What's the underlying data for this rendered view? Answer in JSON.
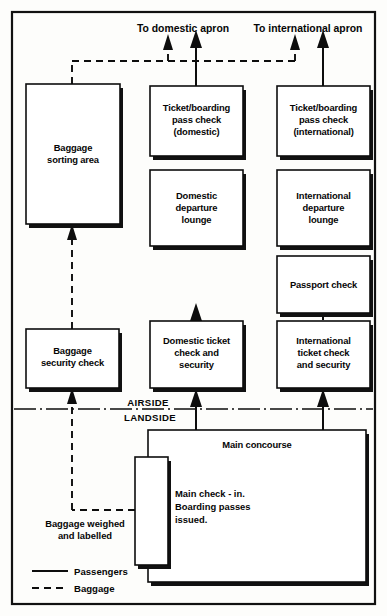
{
  "diagram": {
    "outer_frame": true,
    "apron_labels": [
      {
        "id": "domestic-apron",
        "text": "To domestic apron"
      },
      {
        "id": "international-apron",
        "text": "To international apron"
      }
    ],
    "boxes": [
      {
        "id": "baggage-sorting-area",
        "lines": [
          "Baggage",
          "sorting area"
        ]
      },
      {
        "id": "ticket-boarding-pass-check-domestic",
        "lines": [
          "Ticket/boarding",
          "pass check",
          "(domestic)"
        ]
      },
      {
        "id": "ticket-boarding-pass-check-international",
        "lines": [
          "Ticket/boarding",
          "pass check",
          "(international)"
        ]
      },
      {
        "id": "domestic-departure-lounge",
        "lines": [
          "Domestic",
          "departure",
          "lounge"
        ]
      },
      {
        "id": "international-departure-lounge",
        "lines": [
          "International",
          "departure",
          "lounge"
        ]
      },
      {
        "id": "passport-check",
        "lines": [
          "Passport check"
        ]
      },
      {
        "id": "baggage-security-check",
        "lines": [
          "Baggage",
          "security check"
        ]
      },
      {
        "id": "domestic-ticket-check-and-security",
        "lines": [
          "Domestic ticket",
          "check and",
          "security"
        ]
      },
      {
        "id": "international-ticket-check-and-security",
        "lines": [
          "International",
          "ticket check",
          "and security"
        ]
      },
      {
        "id": "main-concourse",
        "lines": [
          "Main concourse"
        ]
      },
      {
        "id": "main-check-in",
        "lines": []
      }
    ],
    "labels": [
      {
        "id": "airside",
        "text": "AIRSIDE"
      },
      {
        "id": "landside",
        "text": "LANDSIDE"
      },
      {
        "id": "main-check-in-note",
        "lines": [
          "Main check - in.",
          "Boarding passes",
          "issued."
        ]
      },
      {
        "id": "baggage-weighed",
        "lines": [
          "Baggage weighed",
          "and labelled"
        ]
      }
    ],
    "legend": {
      "items": [
        {
          "id": "legend-passengers",
          "label": "Passengers",
          "style": "solid"
        },
        {
          "id": "legend-baggage",
          "label": "Baggage",
          "style": "dashed"
        }
      ]
    },
    "colors": {
      "ink": "#0d0d0d",
      "paper": "#fdfdfb",
      "box_fill": "#ffffff"
    }
  }
}
